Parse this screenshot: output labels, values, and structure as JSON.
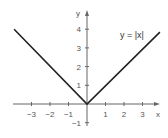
{
  "chart_data": {
    "type": "line",
    "title": "",
    "annotation": "y = |x|",
    "xlabel": "x",
    "ylabel": "y",
    "xlim": [
      -4,
      4
    ],
    "ylim": [
      -1.5,
      4.5
    ],
    "x_ticks": [
      -3,
      -2,
      -1,
      1,
      2,
      3
    ],
    "x_tick_labels": [
      "−3",
      "−2",
      "−1",
      "1",
      "2",
      "3"
    ],
    "y_ticks": [
      -1,
      1,
      2,
      3,
      4
    ],
    "y_tick_labels": [
      "−1",
      "1",
      "2",
      "3",
      "4"
    ],
    "grid": false,
    "legend": null,
    "series": [
      {
        "name": "y = |x|",
        "x": [
          -4,
          0,
          4
        ],
        "y": [
          4,
          0,
          4
        ],
        "color": "#222222"
      }
    ]
  }
}
